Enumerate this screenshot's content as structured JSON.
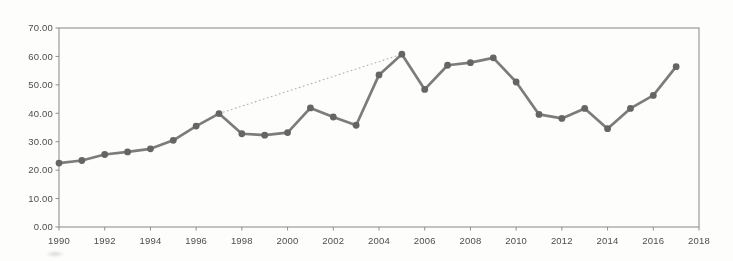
{
  "page": {
    "background_color": "#fdfdfc"
  },
  "style": {
    "frame_color": "#9b9b9b",
    "tick_color": "#8f8f8f",
    "label_color": "#4d4d4d",
    "line_color": "#7c7c7c",
    "marker_color": "#656565",
    "trend_color": "#aeaeae"
  },
  "chart_data": {
    "type": "line",
    "title": "",
    "xlabel": "",
    "ylabel": "",
    "xlim": [
      1990,
      2018
    ],
    "ylim": [
      0,
      70
    ],
    "grid": false,
    "legend": "none",
    "frame": true,
    "x_tick_labels": [
      "1990",
      "1992",
      "1994",
      "1996",
      "1998",
      "2000",
      "2002",
      "2004",
      "2006",
      "2008",
      "2010",
      "2012",
      "2014",
      "2016",
      "2018"
    ],
    "x_tick_values": [
      1990,
      1992,
      1994,
      1996,
      1998,
      2000,
      2002,
      2004,
      2006,
      2008,
      2010,
      2012,
      2014,
      2016,
      2018
    ],
    "y_tick_labels": [
      "0.00",
      "10.00",
      "20.00",
      "30.00",
      "40.00",
      "50.00",
      "60.00",
      "70.00"
    ],
    "y_tick_values": [
      0,
      10,
      20,
      30,
      40,
      50,
      60,
      70
    ],
    "x": [
      1990,
      1991,
      1992,
      1993,
      1994,
      1995,
      1996,
      1997,
      1998,
      1999,
      2000,
      2001,
      2002,
      2003,
      2004,
      2005,
      2006,
      2007,
      2008,
      2009,
      2010,
      2011,
      2012,
      2013,
      2014,
      2015,
      2016,
      2017
    ],
    "series": [
      {
        "name": "value-by-year",
        "values": [
          22.5,
          23.4,
          25.5,
          26.4,
          27.5,
          30.5,
          35.5,
          39.9,
          32.8,
          32.3,
          33.2,
          41.9,
          38.7,
          35.8,
          53.5,
          60.8,
          48.4,
          56.9,
          57.8,
          59.5,
          51.0,
          39.6,
          38.2,
          41.7,
          34.6,
          41.7,
          46.3,
          56.4
        ]
      }
    ],
    "trendline": {
      "style": "dotted",
      "x": [
        1997,
        2005
      ],
      "values": [
        39.9,
        60.8
      ]
    }
  },
  "layout": {
    "plot": {
      "left": 59,
      "top": 28,
      "right": 699,
      "bottom": 227
    },
    "svg": {
      "width": 733,
      "height": 261
    }
  }
}
